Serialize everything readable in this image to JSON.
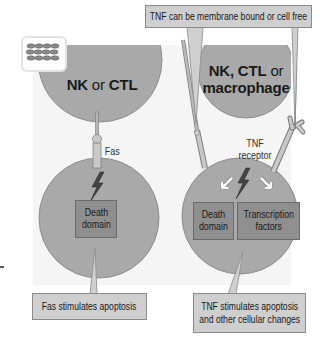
{
  "diagram": {
    "badge_icon": "cell-layer-icon",
    "top_callout": "TNF can be membrane bound or cell free",
    "left": {
      "effector": {
        "part1": "NK",
        "part2": " or ",
        "part3": "CTL"
      },
      "ligand_label": "Fas",
      "signal_icon": "lightning-bolt-icon",
      "box": "Death domain",
      "box_line1": "Death",
      "box_line2": "domain",
      "result_callout": "Fas stimulates apoptosis"
    },
    "right": {
      "effector": {
        "line1_bold": "NK, CTL",
        "line1_light": " or",
        "line2": "macrophage"
      },
      "receptor_line1": "TNF",
      "receptor_line2": "receptor",
      "signal_icon": "lightning-bolt-icon",
      "box1_line1": "Death",
      "box1_line2": "domain",
      "box2_line1": "Transcription",
      "box2_line2": "factors",
      "result_line1": "TNF stimulates apoptosis",
      "result_line2": "and other cellular changes"
    },
    "colors": {
      "cell": "#a9a9a9",
      "cell_border": "#8c8c8c",
      "box": "#8f8f8f",
      "callout": "#cfcfcf",
      "panel": "#f5f5f5"
    }
  }
}
